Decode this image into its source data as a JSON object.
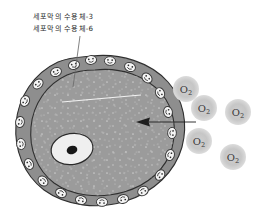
{
  "diagram": {
    "annotations": {
      "line1": "세포막의 수용체-3",
      "line2": "세포막의 수용체-6"
    },
    "colors": {
      "membrane_band": "#8e8e8e",
      "cytoplasm": "#9b9b9b",
      "cytoplasm_speckle": "#c9c9c9",
      "protein_fill": "#f4f4f4",
      "protein_stroke": "#3a3a3a",
      "nucleus_fill": "#efefef",
      "nucleolus": "#171717",
      "o2_halo": "#c4c4c4",
      "o2_ring": "#4a4a4a",
      "outline": "#2f2f2f",
      "leader_line": "#6b6b6b",
      "arrow": "#1e1e1e",
      "background": "#ffffff"
    },
    "cell": {
      "label": "cell",
      "membrane_label": "cell-membrane",
      "cytoplasm_label": "cytoplasm",
      "nucleus_label": "nucleus",
      "nucleolus_label": "nucleolus",
      "membrane_protein_count": 24
    },
    "oxygen": {
      "label": "O",
      "subscript": "2",
      "count": 5,
      "molecules": [
        {
          "name": "o2-molecule-1",
          "cx": 186,
          "cy": 89,
          "r": 13
        },
        {
          "name": "o2-molecule-2",
          "cx": 204,
          "cy": 108,
          "r": 13
        },
        {
          "name": "o2-molecule-3",
          "cx": 238,
          "cy": 112,
          "r": 13
        },
        {
          "name": "o2-molecule-4",
          "cx": 199,
          "cy": 141,
          "r": 13
        },
        {
          "name": "o2-molecule-5",
          "cx": 233,
          "cy": 157,
          "r": 13
        }
      ]
    },
    "arrow": {
      "label": "diffusion-arrow",
      "from_x": 196,
      "from_y": 122,
      "to_x": 138,
      "to_y": 122,
      "direction": "into-cell"
    },
    "leaders": {
      "protein_leader": {
        "x1": 80,
        "y1": 36,
        "x2": 73,
        "y2": 87
      },
      "inner_leader": {
        "x1": 62,
        "y1": 102,
        "x2": 141,
        "y2": 95
      }
    }
  }
}
